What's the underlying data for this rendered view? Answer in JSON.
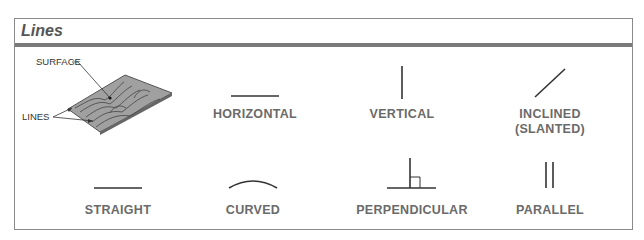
{
  "panel": {
    "title": "Lines"
  },
  "illustration": {
    "surface_label": "SURFACE",
    "lines_label": "LINES"
  },
  "items": [
    {
      "label": "HORIZONTAL",
      "icon": "horizontal-line"
    },
    {
      "label": "VERTICAL",
      "icon": "vertical-line"
    },
    {
      "label": "INCLINED",
      "label2": "(SLANTED)",
      "icon": "inclined-line"
    },
    {
      "label": "STRAIGHT",
      "icon": "straight-line"
    },
    {
      "label": "CURVED",
      "icon": "curved-line"
    },
    {
      "label": "PERPENDICULAR",
      "icon": "perpendicular-lines"
    },
    {
      "label": "PARALLEL",
      "icon": "parallel-lines"
    }
  ],
  "colors": {
    "border": "#8a8a8a",
    "header_rule": "#7a7a7a",
    "title": "#555555",
    "label": "#6a6a6a",
    "line": "#333333",
    "board": "#9a9a9a"
  }
}
